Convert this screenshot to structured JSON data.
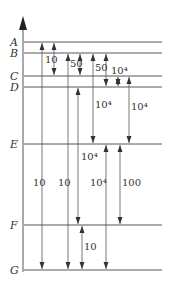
{
  "diagram": {
    "type": "energy-level",
    "levels": [
      {
        "name": "A",
        "y": 42
      },
      {
        "name": "B",
        "y": 53
      },
      {
        "name": "C",
        "y": 76
      },
      {
        "name": "D",
        "y": 87
      },
      {
        "name": "E",
        "y": 144
      },
      {
        "name": "F",
        "y": 225
      },
      {
        "name": "G",
        "y": 270
      }
    ],
    "transitions": [
      {
        "from": "A",
        "to": "G",
        "x": 42,
        "label": "10",
        "label_x": 33,
        "label_y": 186
      },
      {
        "from": "A",
        "to": "C",
        "x": 54,
        "label": "10",
        "label_x": 45,
        "label_y": 63
      },
      {
        "from": "B",
        "to": "G",
        "x": 68,
        "label": "10",
        "label_x": 58,
        "label_y": 186
      },
      {
        "from": "B",
        "to": "C",
        "x": 80,
        "label": "50",
        "label_x": 70,
        "label_y": 67
      },
      {
        "from": "D",
        "to": "F",
        "x": 78,
        "label": "10⁴",
        "label_x": 81,
        "label_y": 160
      },
      {
        "from": "B",
        "to": "E",
        "x": 93,
        "label": "10⁴",
        "label_x": 95,
        "label_y": 108
      },
      {
        "from": "B",
        "to": "D",
        "x": 106,
        "label": "50",
        "label_x": 95,
        "label_y": 71
      },
      {
        "from": "C",
        "to": "D",
        "x": 118,
        "label": "10⁴",
        "label_x": 111,
        "label_y": 74
      },
      {
        "from": "C",
        "to": "E",
        "x": 129,
        "label": "10⁴",
        "label_x": 131,
        "label_y": 110
      },
      {
        "from": "E",
        "to": "G",
        "x": 106,
        "label": "10⁴",
        "label_x": 90,
        "label_y": 186
      },
      {
        "from": "E",
        "to": "F",
        "x": 120,
        "label": "100",
        "label_x": 122,
        "label_y": 186
      },
      {
        "from": "F",
        "to": "G",
        "x": 82,
        "label": "10",
        "label_x": 84,
        "label_y": 250
      }
    ]
  }
}
